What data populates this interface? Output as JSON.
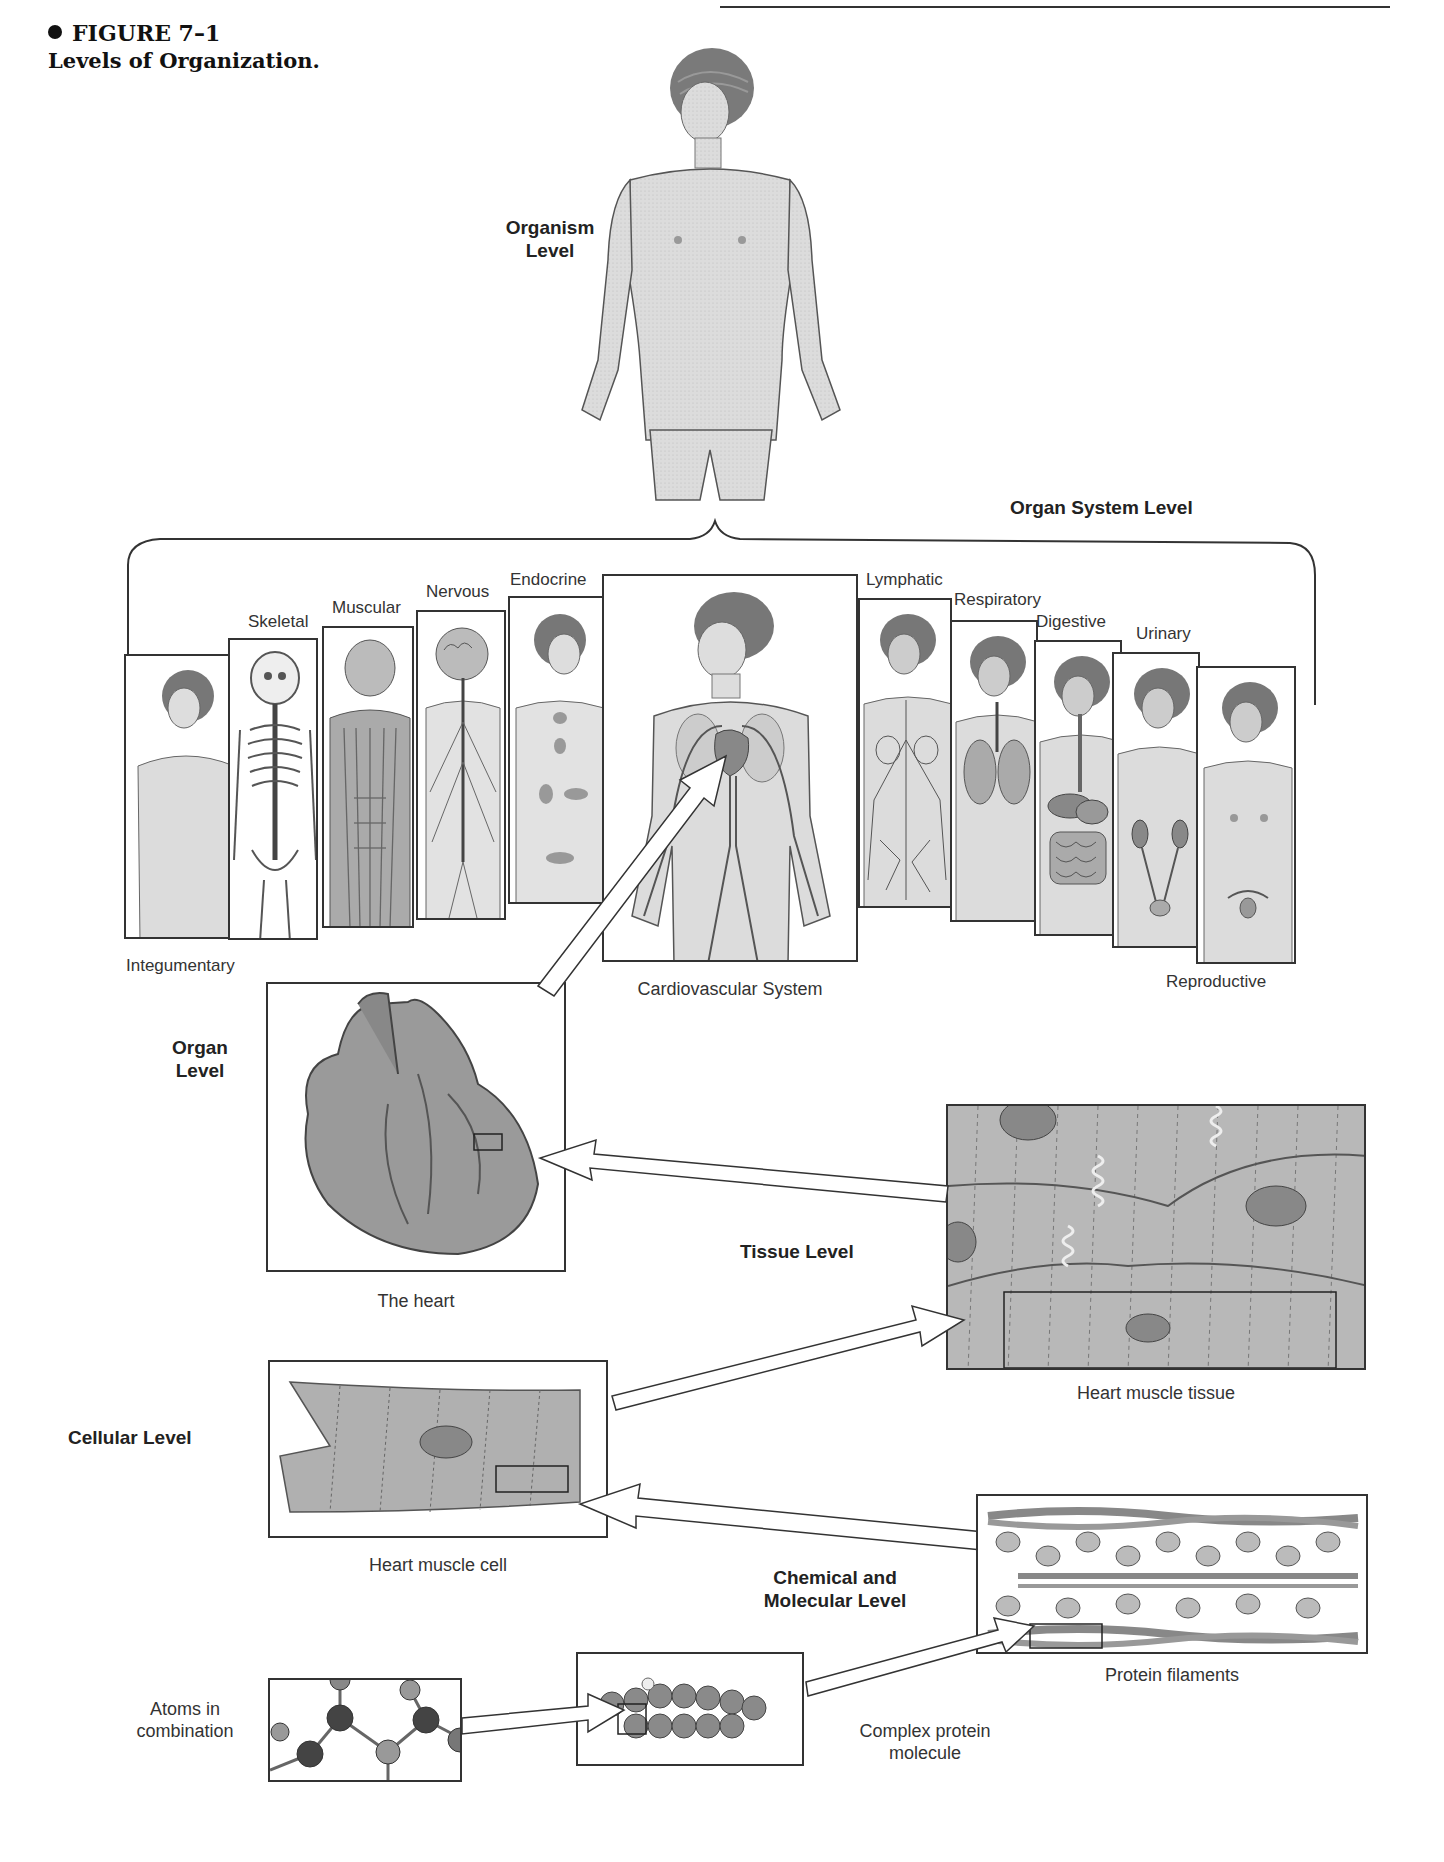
{
  "header": {
    "figure_number": "FIGURE 7–1",
    "figure_caption": "Levels of Organization."
  },
  "levels": {
    "organism": "Organism\nLevel",
    "organism_line1": "Organism",
    "organism_line2": "Level",
    "organ_system": "Organ System Level",
    "organ_line1": "Organ",
    "organ_line2": "Level",
    "tissue": "Tissue Level",
    "cellular": "Cellular Level",
    "chemical_line1": "Chemical and",
    "chemical_line2": "Molecular Level"
  },
  "organ_systems": [
    {
      "label": "Integumentary"
    },
    {
      "label": "Skeletal"
    },
    {
      "label": "Muscular"
    },
    {
      "label": "Nervous"
    },
    {
      "label": "Endocrine"
    },
    {
      "label": "Cardiovascular System"
    },
    {
      "label": "Lymphatic"
    },
    {
      "label": "Respiratory"
    },
    {
      "label": "Digestive"
    },
    {
      "label": "Urinary"
    },
    {
      "label": "Reproductive"
    }
  ],
  "captions": {
    "heart": "The heart",
    "tissue": "Heart muscle tissue",
    "cell": "Heart muscle cell",
    "filaments": "Protein filaments",
    "protein_line1": "Complex protein",
    "protein_line2": "molecule",
    "atoms_line1": "Atoms in",
    "atoms_line2": "combination"
  },
  "colors": {
    "ink": "#333333",
    "skin": "#d9d9d9",
    "tissue": "#b8b8b8",
    "hair": "#6e6e6e"
  }
}
